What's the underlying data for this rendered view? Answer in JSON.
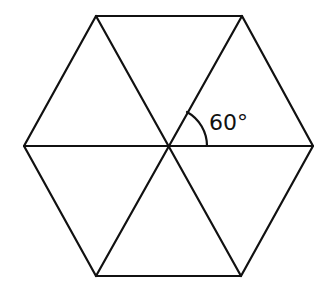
{
  "diagram": {
    "type": "regular-hexagon-divided-into-equilateral-triangles",
    "stroke_color": "#111111",
    "background": "#ffffff",
    "angle_label": "60°",
    "vertices": {
      "top_left": [
        96,
        16
      ],
      "top_right": [
        242,
        16
      ],
      "right": [
        313,
        146
      ],
      "bottom_right": [
        241,
        276
      ],
      "bottom_left": [
        96,
        276
      ],
      "left": [
        24,
        146
      ],
      "center": [
        168,
        146
      ]
    },
    "triangle_count": 6
  }
}
